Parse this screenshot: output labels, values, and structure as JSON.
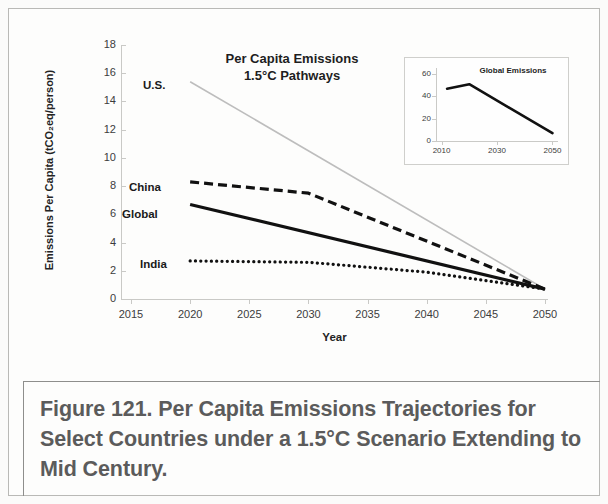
{
  "figure": {
    "caption": "Figure 121. Per Capita Emissions Trajectories for Select Countries under a 1.5°C Scenario Extending to Mid Century."
  },
  "chart_data": {
    "type": "line",
    "title": "Per Capita Emissions\n1.5°C Pathways",
    "title_line1": "Per Capita Emissions",
    "title_line2": "1.5°C Pathways",
    "xlabel": "Year",
    "ylabel": "Emissions Per Capita (tCO₂eq/person)",
    "xlim": [
      2015,
      2050
    ],
    "ylim": [
      0,
      18
    ],
    "xticks": [
      2015,
      2020,
      2025,
      2030,
      2035,
      2040,
      2045,
      2050
    ],
    "yticks": [
      0,
      2,
      4,
      6,
      8,
      10,
      12,
      14,
      16,
      18
    ],
    "grid": false,
    "legend_position": "inline-left-labels",
    "series": [
      {
        "name": "U.S.",
        "style": "solid-light",
        "color": "#bdbdbd",
        "x": [
          2020,
          2050
        ],
        "values": [
          15.4,
          0.7
        ]
      },
      {
        "name": "China",
        "style": "dashed",
        "color": "#111111",
        "x": [
          2020,
          2030,
          2050
        ],
        "values": [
          8.3,
          7.5,
          0.7
        ]
      },
      {
        "name": "Global",
        "style": "solid-bold",
        "color": "#111111",
        "x": [
          2020,
          2050
        ],
        "values": [
          6.7,
          0.7
        ]
      },
      {
        "name": "India",
        "style": "dotted",
        "color": "#111111",
        "x": [
          2020,
          2030,
          2040,
          2050
        ],
        "values": [
          2.7,
          2.6,
          1.9,
          0.7
        ]
      }
    ]
  },
  "inset_chart": {
    "type": "line",
    "title": "Global Emissions",
    "xlim": [
      2008,
      2052
    ],
    "ylim": [
      0,
      62
    ],
    "xticks": [
      2010,
      2030,
      2050
    ],
    "yticks": [
      0,
      20,
      40,
      60
    ],
    "grid": false,
    "series": [
      {
        "name": "Global Emissions",
        "color": "#111111",
        "x": [
          2012,
          2020,
          2050
        ],
        "values": [
          47,
          51,
          7
        ]
      }
    ]
  }
}
